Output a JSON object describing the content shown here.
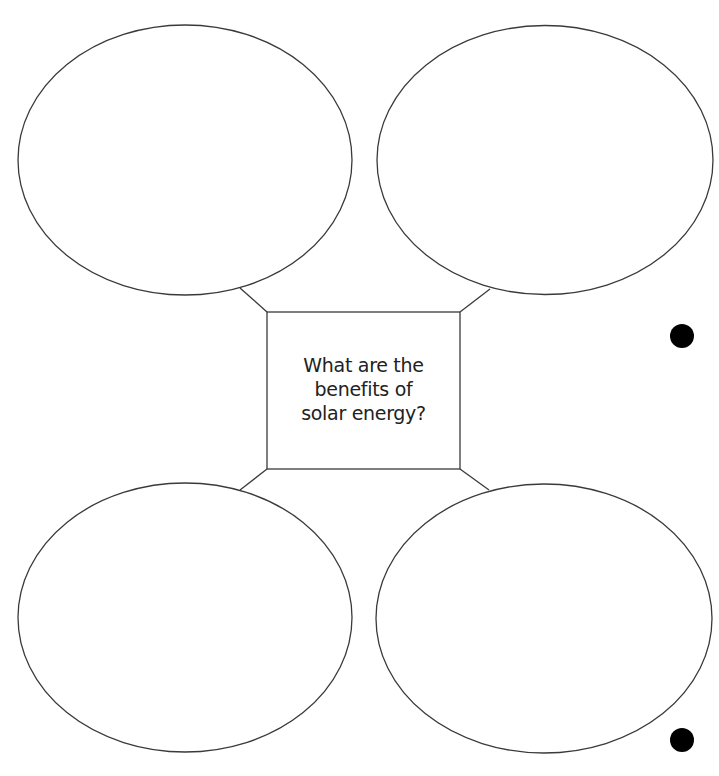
{
  "diagram": {
    "type": "bubble-map",
    "center": {
      "lines": [
        "What are the",
        "benefits of",
        "solar energy?"
      ],
      "text": "What are the benefits of solar energy?"
    },
    "bubbles": [
      {
        "position": "top-left",
        "text": ""
      },
      {
        "position": "top-right",
        "text": ""
      },
      {
        "position": "bottom-left",
        "text": ""
      },
      {
        "position": "bottom-right",
        "text": ""
      }
    ],
    "binder_holes": 2,
    "colors": {
      "stroke": "#3a3a3a",
      "text": "#222222",
      "hole": "#000000",
      "background": "#ffffff"
    }
  }
}
